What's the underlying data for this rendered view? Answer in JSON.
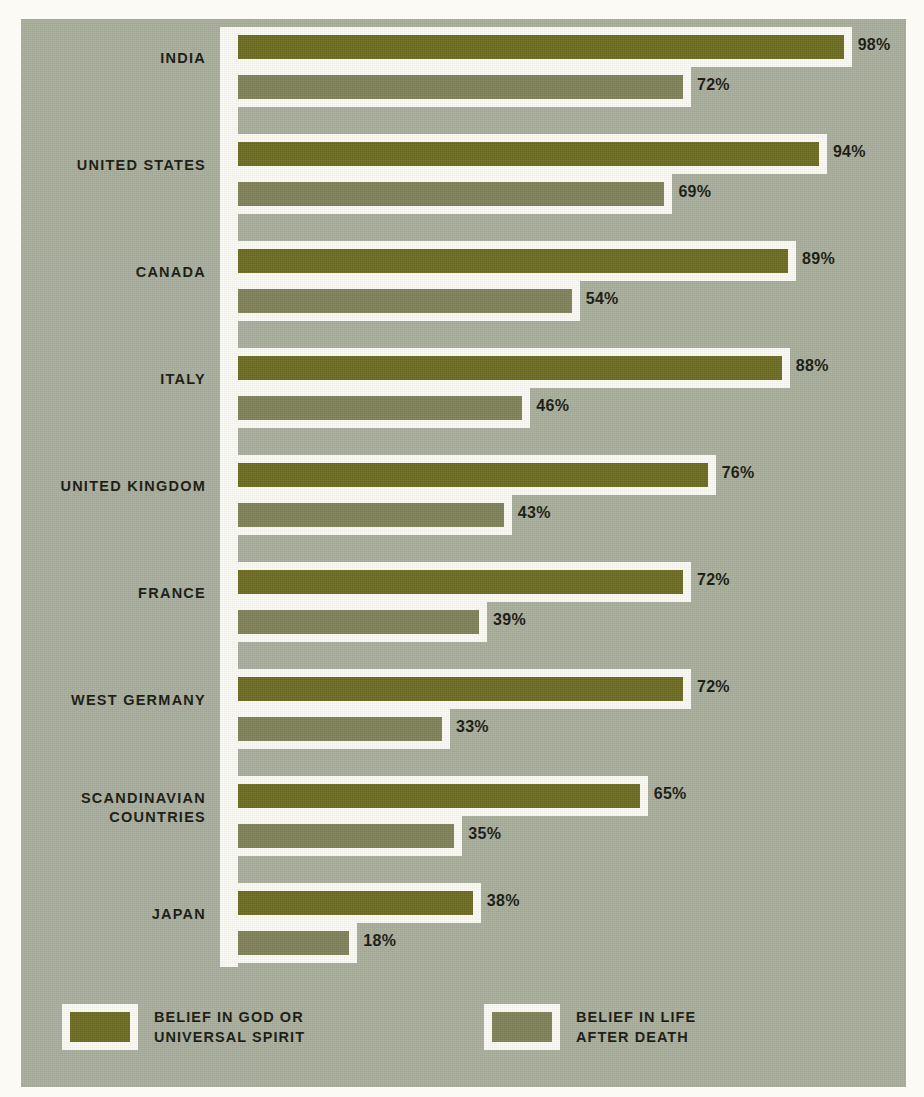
{
  "chart_data": {
    "type": "bar",
    "orientation": "horizontal",
    "title": "",
    "subtitle": "",
    "xlabel": "",
    "ylabel": "",
    "xlim": [
      0,
      100
    ],
    "grid": false,
    "value_suffix": "%",
    "legend_position": "bottom",
    "categories": [
      "INDIA",
      "UNITED STATES",
      "CANADA",
      "ITALY",
      "UNITED KINGDOM",
      "FRANCE",
      "WEST GERMANY",
      "SCANDINAVIAN\nCOUNTRIES",
      "JAPAN"
    ],
    "series": [
      {
        "name": "BELIEF IN GOD OR\nUNIVERSAL SPIRIT",
        "color": "#6c6b20",
        "values": [
          98,
          94,
          89,
          88,
          76,
          72,
          72,
          65,
          38
        ],
        "labels": [
          "98%",
          "94%",
          "89%",
          "88%",
          "76%",
          "72%",
          "72%",
          "65%",
          "38%"
        ]
      },
      {
        "name": "BELIEF IN LIFE\nAFTER DEATH",
        "color": "#7f8158",
        "values": [
          72,
          69,
          54,
          46,
          43,
          39,
          33,
          35,
          18
        ],
        "labels": [
          "72%",
          "69%",
          "54%",
          "46%",
          "43%",
          "39%",
          "33%",
          "35%",
          "18%"
        ]
      }
    ]
  },
  "legend": {
    "items": [
      {
        "label": "BELIEF IN GOD OR\nUNIVERSAL SPIRIT",
        "color": "#6c6b20"
      },
      {
        "label": "BELIEF IN LIFE\nAFTER DEATH",
        "color": "#7f8158"
      }
    ]
  },
  "theme": {
    "background": "#a9ad9b",
    "page_margin": "#fbfaf4",
    "ink": "#17180f",
    "primary": "#6c6b20",
    "secondary": "#7f8158"
  }
}
